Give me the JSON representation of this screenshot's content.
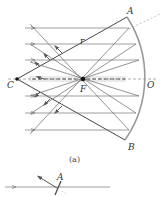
{
  "figure": {
    "caption": "(a)",
    "labels": {
      "A": "A",
      "B": "B",
      "C": "C",
      "F": "F",
      "O": "O",
      "r": "r"
    },
    "colors": {
      "ray": "#666666",
      "mirror": "#888888",
      "radius": "#333333",
      "axis": "#999999"
    }
  },
  "inset": {
    "label": "A",
    "description": "Single ray reflecting at mirror point A"
  }
}
